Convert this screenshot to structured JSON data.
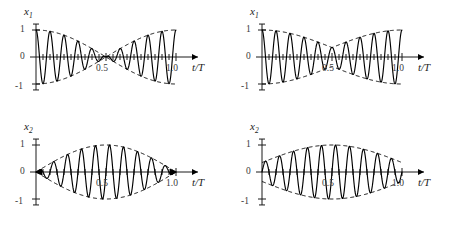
{
  "figure": {
    "background_color": "#ffffff",
    "line_color": "#000000",
    "panel_count": 4,
    "layout": "2x2 grid"
  },
  "chart_data": [
    {
      "id": "top-left",
      "type": "line",
      "title": "",
      "xlabel": "t/T",
      "ylabel": "x1",
      "ylabel_display": "x",
      "ylabel_sub": "1",
      "xlim": [
        0,
        1.08
      ],
      "ylim": [
        -1.25,
        1.25
      ],
      "xticks": [
        0.5,
        1.0
      ],
      "xtick_labels": [
        "0.5",
        "1.0"
      ],
      "yticks": [
        -1,
        0,
        1
      ],
      "ytick_labels": [
        "-1",
        "0",
        "1"
      ],
      "grid": false,
      "legend": "none",
      "carrier_cycles": 10,
      "envelope_kind": "cosine",
      "envelope_amplitude": 1.0,
      "envelope_min": 0.0,
      "envelope_min_at": 0.5,
      "envelope_start": 1.0,
      "envelope_end": 1.0,
      "series": [
        {
          "name": "carrier",
          "style": "solid",
          "description": "x1 = cos(pi*t/T)*cos(20*pi*t/T)"
        },
        {
          "name": "envelope-upper",
          "style": "dashed",
          "description": "+|cos(pi*t/T)|"
        },
        {
          "name": "envelope-lower",
          "style": "dashed",
          "description": "-|cos(pi*t/T)|"
        }
      ]
    },
    {
      "id": "top-right",
      "type": "line",
      "title": "",
      "xlabel": "t/T",
      "ylabel": "x1",
      "ylabel_display": "x",
      "ylabel_sub": "1",
      "xlim": [
        0,
        1.08
      ],
      "ylim": [
        -1.25,
        1.25
      ],
      "xticks": [
        0.5,
        1.0
      ],
      "xtick_labels": [
        "0.5",
        "1.0"
      ],
      "yticks": [
        -1,
        0,
        1
      ],
      "ytick_labels": [
        "-1",
        "0",
        "1"
      ],
      "grid": false,
      "legend": "none",
      "carrier_cycles": 10,
      "envelope_kind": "cosine-offset",
      "envelope_amplitude": 1.0,
      "envelope_min": 0.35,
      "envelope_min_at": 0.5,
      "envelope_start": 1.0,
      "envelope_end": 1.0,
      "series": [
        {
          "name": "carrier",
          "style": "solid",
          "description": "incomplete beat, amplitude minimum 0.35"
        },
        {
          "name": "envelope-upper",
          "style": "dashed",
          "description": "+(0.35+0.65*|cos(pi*t/T)|)"
        },
        {
          "name": "envelope-lower",
          "style": "dashed",
          "description": "-(0.35+0.65*|cos(pi*t/T)|)"
        }
      ]
    },
    {
      "id": "bottom-left",
      "type": "line",
      "title": "",
      "xlabel": "t/T",
      "ylabel": "x2",
      "ylabel_display": "x",
      "ylabel_sub": "2",
      "xlim": [
        0,
        1.08
      ],
      "ylim": [
        -1.25,
        1.25
      ],
      "xticks": [
        0.5,
        1.0
      ],
      "xtick_labels": [
        "0.5",
        "1.0"
      ],
      "yticks": [
        -1,
        0,
        1
      ],
      "ytick_labels": [
        "-1",
        "0",
        "1"
      ],
      "grid": false,
      "legend": "none",
      "carrier_cycles": 10,
      "envelope_kind": "sine",
      "envelope_amplitude": 1.0,
      "envelope_min": 0.0,
      "envelope_max_at": 0.5,
      "envelope_start": 0.0,
      "envelope_end": 0.0,
      "series": [
        {
          "name": "carrier",
          "style": "solid",
          "description": "x2 = sin(pi*t/T)*sin(20*pi*t/T)"
        },
        {
          "name": "envelope-upper",
          "style": "dashed",
          "description": "+|sin(pi*t/T)|"
        },
        {
          "name": "envelope-lower",
          "style": "dashed",
          "description": "-|sin(pi*t/T)|"
        }
      ]
    },
    {
      "id": "bottom-right",
      "type": "line",
      "title": "",
      "xlabel": "t/T",
      "ylabel": "x2",
      "ylabel_display": "x",
      "ylabel_sub": "2",
      "xlim": [
        0,
        1.08
      ],
      "ylim": [
        -1.25,
        1.25
      ],
      "xticks": [
        0.5,
        1.0
      ],
      "xtick_labels": [
        "0.5",
        "1.0"
      ],
      "yticks": [
        -1,
        0,
        1
      ],
      "ytick_labels": [
        "-1",
        "0",
        "1"
      ],
      "grid": false,
      "legend": "none",
      "carrier_cycles": 10,
      "envelope_kind": "sine-offset",
      "envelope_amplitude": 1.0,
      "envelope_min": 0.35,
      "envelope_max_at": 0.5,
      "envelope_start": 0.35,
      "envelope_end": 0.35,
      "series": [
        {
          "name": "carrier",
          "style": "solid",
          "description": "incomplete beat, amplitude minimum 0.35"
        },
        {
          "name": "envelope-upper",
          "style": "dashed",
          "description": "+(0.35+0.65*|sin(pi*t/T)|)"
        },
        {
          "name": "envelope-lower",
          "style": "dashed",
          "description": "-(0.35+0.65*|sin(pi*t/T)|)"
        }
      ]
    }
  ]
}
